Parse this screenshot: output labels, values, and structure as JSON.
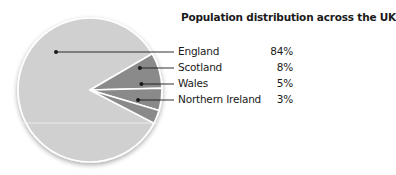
{
  "chart_data": {
    "type": "pie",
    "title": "Population distribution across the UK",
    "categories": [
      "England",
      "Scotland",
      "Wales",
      "Northern Ireland"
    ],
    "values": [
      84,
      8,
      5,
      3
    ],
    "value_labels": [
      "84%",
      "8%",
      "5%",
      "3%"
    ],
    "unit": "%",
    "legend_position": "right",
    "colors": {
      "England": "#d0d0d0",
      "Scotland": "#8a8a8a",
      "Wales": "#8a8a8a",
      "Northern Ireland": "#8a8a8a",
      "separator": "#ffffff",
      "leader_line": "#1a1a1a"
    }
  },
  "legend": [
    {
      "label": "England",
      "value": "84%"
    },
    {
      "label": "Scotland",
      "value": "8%"
    },
    {
      "label": "Wales",
      "value": "5%"
    },
    {
      "label": "Northern Ireland",
      "value": "3%"
    }
  ]
}
